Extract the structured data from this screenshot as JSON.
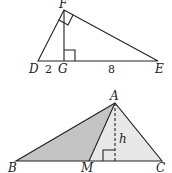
{
  "figure1": {
    "description": "Right triangle DFE with right angle at F, altitude FG to hypotenuse DE",
    "points": {
      "F": {
        "label": "F",
        "x": 64,
        "y": 10
      },
      "D": {
        "label": "D",
        "x": 38,
        "y": 61
      },
      "G": {
        "label": "G",
        "x": 64,
        "y": 61
      },
      "E": {
        "label": "E",
        "x": 158,
        "y": 61
      }
    },
    "segment_labels": {
      "DG": "2",
      "GE": "8"
    },
    "right_angles": [
      "F",
      "G"
    ]
  },
  "figure2": {
    "description": "Triangle ABC with median AM and dashed altitude h; triangle ABM shaded",
    "points": {
      "A": {
        "label": "A",
        "x": 115,
        "y": 103
      },
      "B": {
        "label": "B",
        "x": 16,
        "y": 161
      },
      "M": {
        "label": "M",
        "x": 89,
        "y": 161
      },
      "C": {
        "label": "C",
        "x": 162,
        "y": 161
      }
    },
    "altitude_label": "h",
    "colors": {
      "shaded_dark": "#c4c4c4",
      "shaded_light": "#e6e6e6"
    }
  }
}
